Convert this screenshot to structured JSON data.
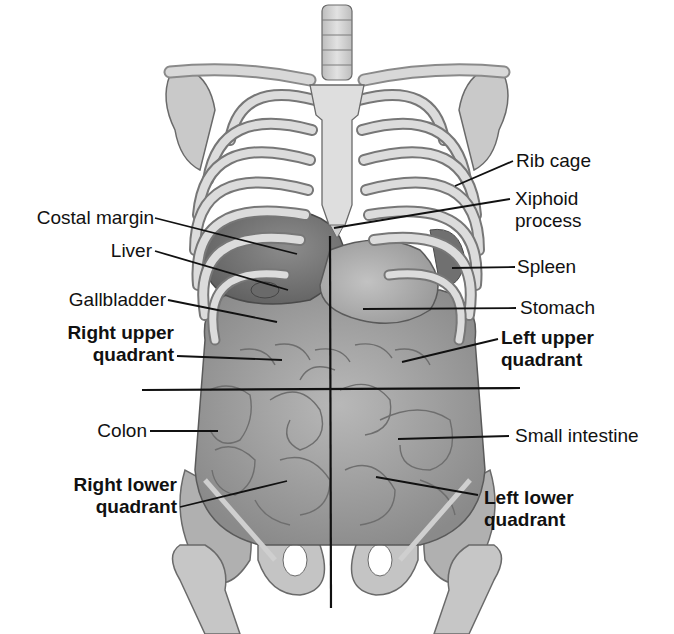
{
  "figure": {
    "labels_left": [
      {
        "id": "costal-margin",
        "text": "Costal margin",
        "bold": false
      },
      {
        "id": "liver",
        "text": "Liver",
        "bold": false
      },
      {
        "id": "gallbladder",
        "text": "Gallbladder",
        "bold": false
      },
      {
        "id": "right-upper-quadrant",
        "line1": "Right upper",
        "line2": "quadrant",
        "bold": true
      },
      {
        "id": "colon",
        "text": "Colon",
        "bold": false
      },
      {
        "id": "right-lower-quadrant",
        "line1": "Right lower",
        "line2": "quadrant",
        "bold": true
      }
    ],
    "labels_right": [
      {
        "id": "rib-cage",
        "text": "Rib cage",
        "bold": false
      },
      {
        "id": "xiphoid-process",
        "line1": "Xiphoid",
        "line2": "process",
        "bold": false
      },
      {
        "id": "spleen",
        "text": "Spleen",
        "bold": false
      },
      {
        "id": "stomach",
        "text": "Stomach",
        "bold": false
      },
      {
        "id": "left-upper-quadrant",
        "line1": "Left upper",
        "line2": "quadrant",
        "bold": true
      },
      {
        "id": "small-intestine",
        "text": "Small intestine",
        "bold": false
      },
      {
        "id": "left-lower-quadrant",
        "line1": "Left lower",
        "line2": "quadrant",
        "bold": true
      }
    ],
    "colors": {
      "background": "#ffffff",
      "bone_light": "#d9d9d9",
      "bone_mid": "#b5b5b5",
      "bone_dark": "#7a7a7a",
      "organ_light": "#a8a8a8",
      "organ_dark": "#6e6e6e",
      "leader_line": "#111111"
    }
  }
}
